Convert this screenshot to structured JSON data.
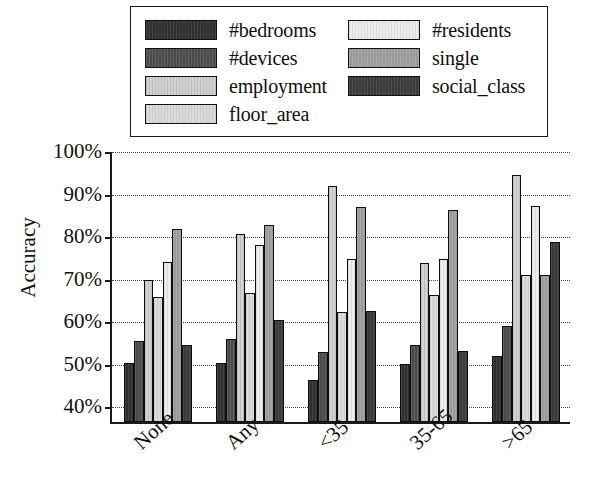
{
  "legend": {
    "entries": [
      {
        "label": "#bedrooms",
        "fill": "f-bedrooms",
        "swatch_color": "#2f2f2f"
      },
      {
        "label": "#residents",
        "fill": "f-residents",
        "swatch_color": "#ececec"
      },
      {
        "label": "#devices",
        "fill": "f-devices",
        "swatch_color": "#4b4b4b"
      },
      {
        "label": "single",
        "fill": "f-single",
        "swatch_color": "#9a9a9a"
      },
      {
        "label": "employment",
        "fill": "f-employment",
        "swatch_color": "#d2d2d2"
      },
      {
        "label": "social_class",
        "fill": "f-social",
        "swatch_color": "#3a3a3a"
      },
      {
        "label": "floor_area",
        "fill": "f-floor",
        "swatch_color": "#dcdcdc"
      }
    ]
  },
  "axis": {
    "ylabel": "Accuracy",
    "yticks": [
      "100%",
      "90%",
      "80%",
      "70%",
      "60%",
      "50%",
      "40%"
    ],
    "xticks": [
      "None",
      "Any",
      "<35",
      "35-65",
      ">65"
    ]
  },
  "chart_data": {
    "type": "bar",
    "title": "",
    "xlabel": "",
    "ylabel": "Accuracy",
    "ylim": [
      36,
      100
    ],
    "ytick_values": [
      40,
      50,
      60,
      70,
      80,
      90,
      100
    ],
    "grid": true,
    "legend_position": "top",
    "categories": [
      "None",
      "Any",
      "<35",
      "35-65",
      ">65"
    ],
    "series": [
      {
        "name": "#bedrooms",
        "fill": "f-bedrooms",
        "values": [
          49.8,
          49.8,
          45.8,
          49.6,
          51.5
        ]
      },
      {
        "name": "#devices",
        "fill": "f-devices",
        "values": [
          55.0,
          55.5,
          52.5,
          54.2,
          58.6
        ]
      },
      {
        "name": "employment",
        "fill": "f-employment",
        "values": [
          69.5,
          80.2,
          91.6,
          73.3,
          94.2
        ]
      },
      {
        "name": "floor_area",
        "fill": "f-floor",
        "values": [
          65.5,
          66.4,
          62.0,
          66.0,
          70.7
        ]
      },
      {
        "name": "#residents",
        "fill": "f-residents",
        "values": [
          73.6,
          77.6,
          74.4,
          74.4,
          86.8
        ]
      },
      {
        "name": "single",
        "fill": "f-single",
        "values": [
          81.4,
          82.4,
          86.6,
          85.8,
          70.7
        ]
      },
      {
        "name": "social_class",
        "fill": "f-social",
        "values": [
          54.2,
          60.0,
          62.2,
          52.7,
          78.4
        ]
      }
    ]
  }
}
